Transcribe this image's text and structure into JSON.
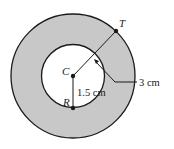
{
  "diagram": {
    "type": "annulus",
    "colors": {
      "shading": "#c8c8c8",
      "stroke": "#1a1a1a",
      "inner_fill": "#ffffff"
    },
    "center": {
      "label": "C"
    },
    "points": [
      {
        "id": "T",
        "label": "T"
      },
      {
        "id": "R",
        "label": "R"
      }
    ],
    "measurements": {
      "inner_radius_label": "1.5 cm",
      "outer_radius_label": "3 cm"
    }
  }
}
